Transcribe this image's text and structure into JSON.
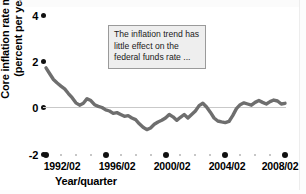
{
  "chart_data": {
    "type": "line",
    "title": "",
    "xlabel": "Year/quarter",
    "ylabel_line1": "Core inflation rate minus 2",
    "ylabel_line2": "(percent per year)",
    "ylim": [
      -2,
      4
    ],
    "yticks": [
      4,
      2,
      0,
      -2
    ],
    "ytick_labels": [
      "4",
      "2",
      "0",
      "-2"
    ],
    "xlim": [
      "1992/02",
      "2008/04"
    ],
    "xtick_labels": [
      "1992/02",
      "1996/02",
      "2000/02",
      "2004/02",
      "2008/02"
    ],
    "xtick_values": [
      1992.25,
      1996.25,
      2000.25,
      2004.25,
      2008.25
    ],
    "grid": "zero-line-only",
    "legend": "none",
    "series": [
      {
        "name": "Core inflation rate minus 2",
        "color": "#6e6e6e",
        "x": [
          1992.25,
          1992.5,
          1992.75,
          1993.0,
          1993.25,
          1993.5,
          1993.75,
          1994.0,
          1994.25,
          1994.5,
          1994.75,
          1995.0,
          1995.25,
          1995.5,
          1995.75,
          1996.0,
          1996.25,
          1996.5,
          1996.75,
          1997.0,
          1997.25,
          1997.5,
          1997.75,
          1998.0,
          1998.25,
          1998.5,
          1998.75,
          1999.0,
          1999.25,
          1999.5,
          1999.75,
          2000.0,
          2000.25,
          2000.5,
          2000.75,
          2001.0,
          2001.25,
          2001.5,
          2001.75,
          2002.0,
          2002.25,
          2002.5,
          2002.75,
          2003.0,
          2003.25,
          2003.5,
          2003.75,
          2004.0,
          2004.25,
          2004.5,
          2004.75,
          2005.0,
          2005.25,
          2005.5,
          2005.75,
          2006.0,
          2006.25,
          2006.5,
          2006.75,
          2007.0,
          2007.25,
          2007.5,
          2007.75,
          2008.0,
          2008.25
        ],
        "y": [
          1.7,
          1.45,
          1.2,
          1.05,
          0.92,
          0.8,
          0.6,
          0.42,
          0.2,
          0.1,
          0.18,
          0.38,
          0.3,
          0.12,
          0.05,
          0.0,
          -0.1,
          -0.15,
          -0.25,
          -0.22,
          -0.3,
          -0.38,
          -0.35,
          -0.45,
          -0.52,
          -0.7,
          -0.85,
          -0.95,
          -0.88,
          -0.72,
          -0.62,
          -0.55,
          -0.45,
          -0.3,
          -0.4,
          -0.55,
          -0.42,
          -0.3,
          -0.45,
          -0.3,
          -0.15,
          0.08,
          0.18,
          0.02,
          -0.2,
          -0.45,
          -0.58,
          -0.62,
          -0.65,
          -0.6,
          -0.35,
          -0.05,
          0.12,
          0.2,
          0.15,
          0.1,
          0.22,
          0.3,
          0.22,
          0.15,
          0.25,
          0.32,
          0.28,
          0.15,
          0.18
        ]
      }
    ],
    "annotation": {
      "lines": [
        "The inflation trend has",
        "little effect on the",
        "federal funds rate ..."
      ],
      "background": "#eeeeee",
      "border": "#9a9a9a"
    }
  }
}
